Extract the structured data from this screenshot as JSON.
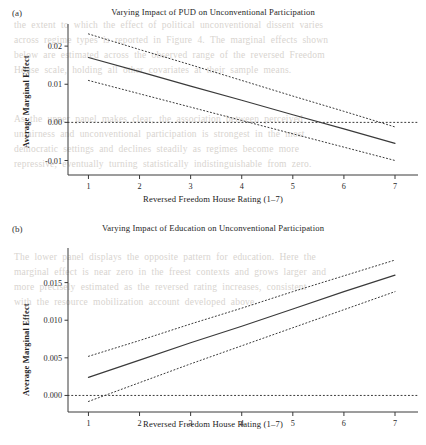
{
  "figure": {
    "background": "#ffffff",
    "line_color": "#3a3a3a",
    "text_color": "#262626"
  },
  "background_text": {
    "block_top": "the  extent  to  which  the  effect  of  political  unconventional  dissent  varies",
    "block_upper": "across  regime  types  is  reported  in  Figure  4.  The  marginal  effects  shown\nbelow  are  estimated  across  the  observed  range  of  the  reversed  Freedom\nHouse  scale,  holding  all  other  covariates  at  their  sample  means.",
    "block_mid": "As  the  upper  panel  makes  clear,  the  association  between  perceived\nunfairness  and  unconventional  participation  is  strongest  in  the  most\ndemocratic  settings  and  declines  steadily  as  regimes  become  more\nrepressive,  eventually  turning  statistically  indistinguishable  from  zero.",
    "block_low": "The  lower  panel  displays  the  opposite  pattern  for  education.  Here  the\nmarginal  effect  is  near  zero  in  the  freest  contexts  and  grows  larger  and\nmore  precisely  estimated  as  the  reversed  rating  increases,  consistent\nwith  the  resource  mobilization  account  developed  above."
  },
  "panels": [
    {
      "id": "a",
      "letter": "(a)",
      "title": "Varying Impact of PUD on Unconventional Participation",
      "ylabel": "Average Marginal Effect",
      "xlabel": "Reversed Freedom House Rating (1–7)"
    },
    {
      "id": "b",
      "letter": "(b)",
      "title": "Varying Impact of Education on Unconventional Participation",
      "ylabel": "Average Marginal Effect",
      "xlabel": "Reversed Freedom House Rating (1–7)"
    }
  ],
  "chart_data": [
    {
      "type": "line",
      "panel": "a",
      "title": "Varying Impact of PUD on Unconventional Participation",
      "xlabel": "Reversed Freedom House Rating (1–7)",
      "ylabel": "Average Marginal Effect",
      "xlim": [
        0.6,
        7.45
      ],
      "ylim": [
        -0.0138,
        0.0258
      ],
      "xticks": [
        1,
        2,
        3,
        4,
        5,
        6,
        7
      ],
      "xtick_labels": [
        "1",
        "2",
        "3",
        "4",
        "5",
        "6",
        "7"
      ],
      "yticks": [
        0.02,
        0.01,
        0.0,
        -0.01
      ],
      "ytick_labels": [
        "0.02",
        "0.01",
        "0.00",
        "-0.01"
      ],
      "grid": false,
      "legend": "none",
      "zero_line": 0.0,
      "x": [
        1,
        2,
        3,
        4,
        5,
        6,
        7
      ],
      "series": [
        {
          "name": "Average marginal effect",
          "style": "solid",
          "values": [
            0.017,
            0.0133,
            0.0095,
            0.0058,
            0.002,
            -0.0017,
            -0.0055
          ]
        },
        {
          "name": "Upper 95% confidence bound",
          "style": "dotted",
          "values": [
            0.0232,
            0.0191,
            0.0151,
            0.011,
            0.0069,
            0.0029,
            -0.0012
          ]
        },
        {
          "name": "Lower 95% confidence bound",
          "style": "dotted",
          "values": [
            0.011,
            0.0075,
            0.004,
            0.0005,
            -0.003,
            -0.0065,
            -0.01
          ]
        }
      ],
      "annotations": [
        "Solid line crosses zero at reversed rating ≈ 5.4",
        "Confidence band includes zero beyond reversed rating ≈ 4.9"
      ]
    },
    {
      "type": "line",
      "panel": "b",
      "title": "Varying Impact of Education on Unconventional Participation",
      "xlabel": "Reversed Freedom House Rating (1–7)",
      "ylabel": "Average Marginal Effect",
      "xlim": [
        0.6,
        7.45
      ],
      "ylim": [
        -0.0022,
        0.0196
      ],
      "xticks": [
        1,
        2,
        3,
        4,
        5,
        6,
        7
      ],
      "xtick_labels": [
        "1",
        "2",
        "3",
        "4",
        "5",
        "6",
        "7"
      ],
      "yticks": [
        0.015,
        0.01,
        0.005,
        0.0
      ],
      "ytick_labels": [
        "0.015",
        "0.010",
        "0.005",
        "0.000"
      ],
      "grid": false,
      "legend": "none",
      "zero_line": 0.0,
      "x": [
        1,
        2,
        3,
        4,
        5,
        6,
        7
      ],
      "series": [
        {
          "name": "Average marginal effect",
          "style": "solid",
          "values": [
            0.0024,
            0.0047,
            0.007,
            0.0092,
            0.0115,
            0.0138,
            0.016
          ]
        },
        {
          "name": "Upper 95% confidence bound",
          "style": "dotted",
          "values": [
            0.0052,
            0.0073,
            0.0095,
            0.0116,
            0.0138,
            0.0159,
            0.018
          ]
        },
        {
          "name": "Lower 95% confidence bound",
          "style": "dotted",
          "values": [
            -0.0008,
            0.0017,
            0.0042,
            0.0066,
            0.009,
            0.0114,
            0.0138
          ]
        }
      ],
      "annotations": [
        "Lower confidence bound crosses zero at reversed rating ≈ 1.3"
      ]
    }
  ]
}
